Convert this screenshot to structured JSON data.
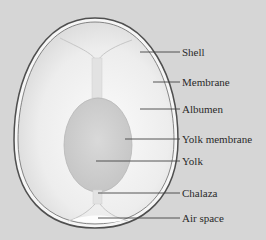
{
  "diagram": {
    "colors": {
      "background": "#d6d6d6",
      "shell_outline": "#555555",
      "shell_fill": "#f4f4f4",
      "albumen": "#e9e9e9",
      "yolk": "#cfcfcf",
      "leader_line": "#444444",
      "label_text": "#2a2a2a"
    },
    "labels": [
      {
        "id": "shell",
        "text": "Shell",
        "y": 52,
        "line_x1": 140
      },
      {
        "id": "membrane",
        "text": "Membrane",
        "y": 82,
        "line_x1": 153
      },
      {
        "id": "albumen",
        "text": "Albumen",
        "y": 109,
        "line_x1": 140
      },
      {
        "id": "yolk-membrane",
        "text": "Yolk membrane",
        "y": 139,
        "line_x1": 125
      },
      {
        "id": "yolk",
        "text": "Yolk",
        "y": 161,
        "line_x1": 96
      },
      {
        "id": "chalaza",
        "text": "Chalaza",
        "y": 193,
        "line_x1": 98
      },
      {
        "id": "air-space",
        "text": "Air space",
        "y": 218,
        "line_x1": 98
      }
    ]
  }
}
